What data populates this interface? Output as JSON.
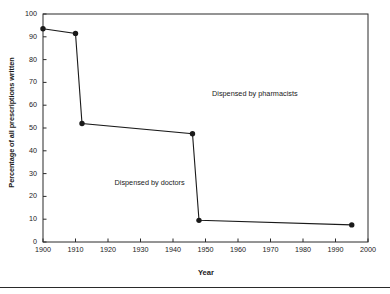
{
  "chart_data": {
    "type": "line",
    "title": "",
    "xlabel": "Year",
    "ylabel": "Percentage of all prescriptions written",
    "xlim": [
      1900,
      2000
    ],
    "ylim": [
      0,
      100
    ],
    "grid": false,
    "legend": "none",
    "xticks": [
      1900,
      1910,
      1920,
      1930,
      1940,
      1950,
      1960,
      1970,
      1980,
      1990,
      2000
    ],
    "yticks": [
      0,
      10,
      20,
      30,
      40,
      50,
      60,
      70,
      80,
      90,
      100
    ],
    "series": [
      {
        "name": "Percentage of all prescriptions written",
        "marker": "filled-circle",
        "color": "#1a1a1a",
        "x": [
          1900,
          1910,
          1912,
          1946,
          1948,
          1995
        ],
        "values": [
          93.5,
          91.5,
          52,
          47.5,
          9.5,
          7.5
        ]
      }
    ],
    "annotations": [
      {
        "text": "Dispensed by pharmacists",
        "x": 1952,
        "y": 65
      },
      {
        "text": "Dispensed by doctors",
        "x": 1922,
        "y": 26
      }
    ]
  }
}
